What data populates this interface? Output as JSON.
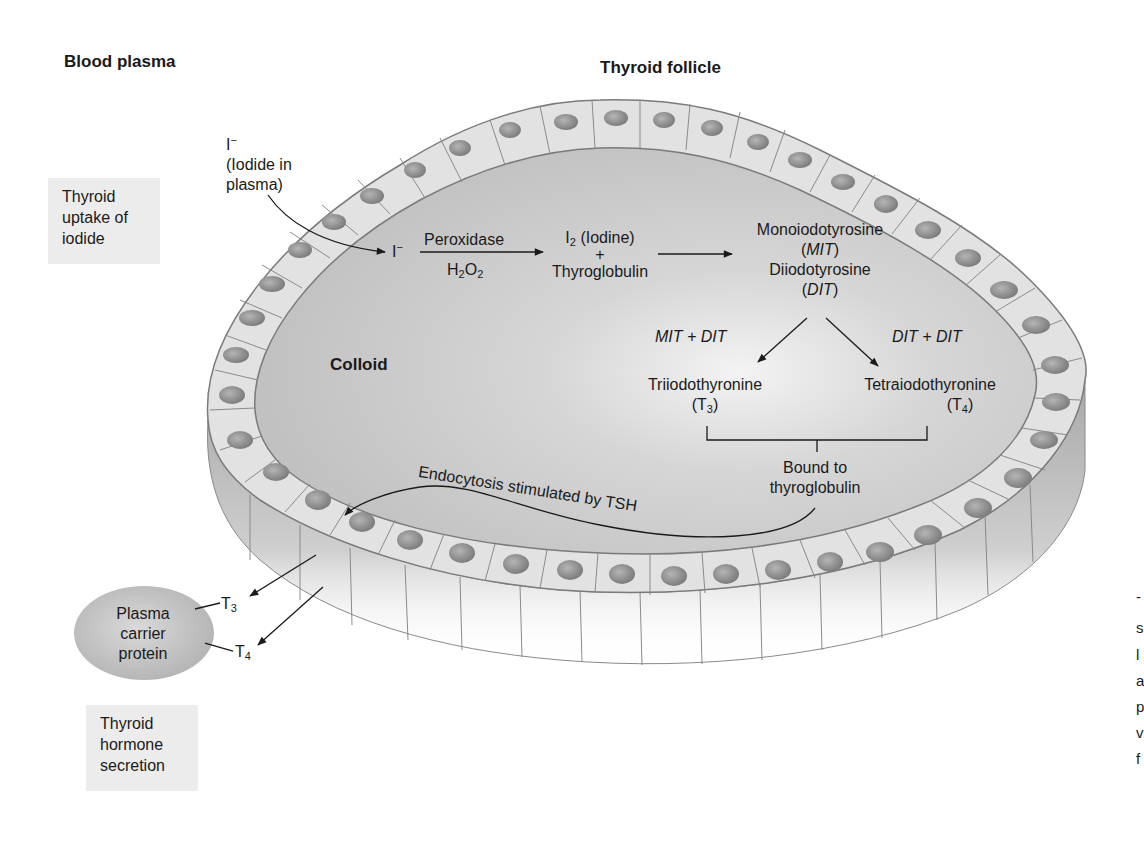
{
  "figure": {
    "region_labels": {
      "blood_plasma": "Blood plasma",
      "thyroid_follicle": "Thyroid follicle",
      "colloid": "Colloid"
    },
    "process_boxes": {
      "uptake": "Thyroid uptake of iodide",
      "uptake_lines": [
        "Thyroid",
        "uptake of",
        "iodide"
      ],
      "secretion": "Thyroid hormone secretion",
      "secretion_lines": [
        "Thyroid",
        "hormone",
        "secretion"
      ]
    },
    "iodide_plasma": {
      "symbol": "I",
      "charge": "−",
      "line1": "(Iodide in",
      "line2": "plasma)"
    },
    "steps": {
      "iodide_in_cell": {
        "symbol": "I",
        "charge": "−"
      },
      "enzyme_above": "Peroxidase",
      "enzyme_below_base": "H",
      "enzyme_below_sub1": "2",
      "enzyme_below_mid": "O",
      "enzyme_below_sub2": "2",
      "iodine": {
        "symbol": "I",
        "sub": "2",
        "name": "(Iodine)"
      },
      "plus": "+",
      "thyroglobulin": "Thyroglobulin",
      "mit_name": "Monoiodotyrosine",
      "mit_abbr": "MIT",
      "dit_name": "Diiodotyrosine",
      "dit_abbr": "DIT",
      "left_combo": "MIT + DIT",
      "right_combo": "DIT + DIT",
      "t3_name": "Triiodothyronine",
      "t3_abbr": "T",
      "t3_sub": "3",
      "t4_name": "Tetraiodothyronine",
      "t4_abbr": "T",
      "t4_sub": "4",
      "bound_line1": "Bound to",
      "bound_line2": "thyroglobulin",
      "endocytosis": "Endocytosis stimulated by TSH"
    },
    "carrier": {
      "line1": "Plasma",
      "line2": "carrier",
      "line3": "protein",
      "t3": "T",
      "t3_sub": "3",
      "t4": "T",
      "t4_sub": "4"
    },
    "cut_off_margin_letters": [
      "-",
      "s",
      "l",
      "a",
      "p",
      "v",
      "f"
    ],
    "colors": {
      "colloid": "#c4c4c4",
      "cell_top": "#e4e4e4",
      "cell_side": "#b0b0b0",
      "nucleus": "#8f8f8f",
      "box_bg": "#ececec",
      "text": "#1a1a1a"
    }
  }
}
